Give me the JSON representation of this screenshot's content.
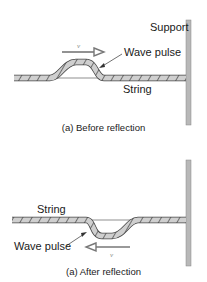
{
  "panel_a": {
    "support_label": "Support",
    "pulse_label": "Wave pulse",
    "string_label": "String",
    "velocity_label": "v",
    "caption": "(a) Before reflection"
  },
  "panel_b": {
    "string_label": "String",
    "pulse_label": "Wave pulse",
    "velocity_label": "v",
    "caption": "(a) After reflection"
  },
  "colors": {
    "rope_fill": "#c8c8c8",
    "rope_stroke": "#555555",
    "support": "#b5b5b5",
    "arrow": "#777777"
  }
}
